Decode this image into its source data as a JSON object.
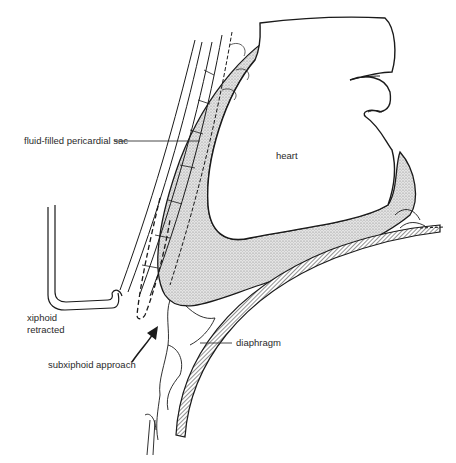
{
  "diagram": {
    "type": "anatomical line illustration",
    "colors": {
      "ink": "#1a1a1a",
      "stipple": "#cfcfcf",
      "background": "#ffffff"
    },
    "labels": {
      "pericardial_sac": "fluid-filled pericardial sac",
      "heart": "heart",
      "xiphoid_line1": "xiphoid",
      "xiphoid_line2": "retracted",
      "approach": "subxiphoid approach",
      "diaphragm": "diaphragm"
    }
  }
}
